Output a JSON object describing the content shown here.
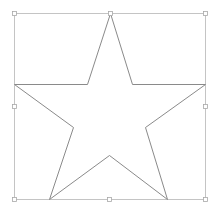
{
  "canvas": {
    "width": 218,
    "height": 209,
    "background": "#ffffff"
  },
  "colors": {
    "bbox_stroke": "#c4c4c4",
    "star_stroke": "#8a8a8a",
    "handle_stroke": "#a8a8a8",
    "handle_fill": "#ffffff"
  },
  "selection_box": {
    "x": 14,
    "y": 13,
    "width": 191,
    "height": 186
  },
  "star": {
    "shape": "five-point-star",
    "points": [
      [
        110,
        13
      ],
      [
        132,
        84
      ],
      [
        205,
        84
      ],
      [
        145,
        127
      ],
      [
        167,
        199
      ],
      [
        109,
        155
      ],
      [
        49,
        199
      ],
      [
        73,
        127
      ],
      [
        14,
        84
      ],
      [
        87,
        84
      ]
    ]
  },
  "handles": [
    {
      "name": "handle-top-left",
      "x": 14,
      "y": 13
    },
    {
      "name": "handle-top-middle",
      "x": 110,
      "y": 13
    },
    {
      "name": "handle-top-right",
      "x": 205,
      "y": 13
    },
    {
      "name": "handle-middle-left",
      "x": 14,
      "y": 106
    },
    {
      "name": "handle-middle-right",
      "x": 205,
      "y": 106
    },
    {
      "name": "handle-bottom-left",
      "x": 14,
      "y": 199
    },
    {
      "name": "handle-bottom-middle",
      "x": 109,
      "y": 199
    },
    {
      "name": "handle-bottom-right",
      "x": 205,
      "y": 199
    }
  ]
}
